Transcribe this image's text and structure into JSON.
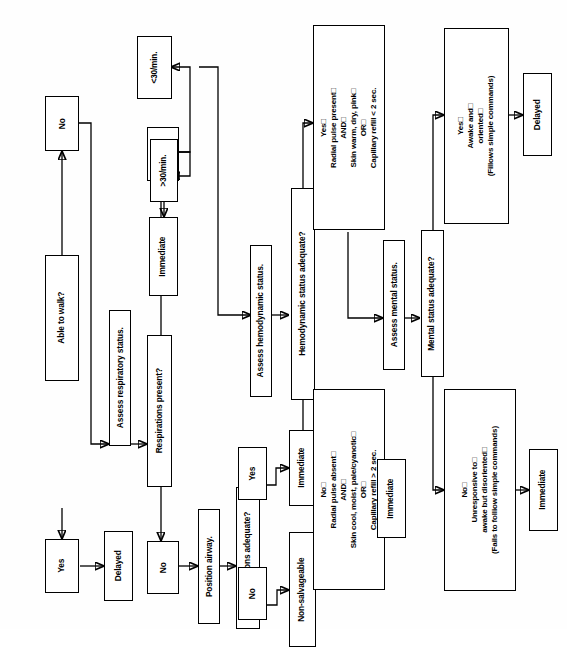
{
  "diagram": {
    "orientation": "rotated-90-counterclockwise",
    "line_color": "#000000",
    "box_fill": "#ffffff",
    "box_stroke": "#000000"
  },
  "nodes": {
    "able_to_walk": "Able to walk?",
    "walk_yes": "Yes",
    "walk_no": "No",
    "delayed_walk": "Delayed",
    "assess_respiratory": "Assess respiratory status.",
    "respirations_present": "Respirations present?",
    "resp_yes": "Yes",
    "resp_no": "No",
    "rate_over_30": ">30/min.",
    "rate_under_30": "<30/min.",
    "immediate_rate": "Immediate",
    "position_airway": "Position airway.",
    "respirations_adequate": "Respirations adequate?",
    "airway_yes": "Yes",
    "airway_no": "No",
    "immediate_airway": "Immediate",
    "non_salvageable": "Non-salvageable",
    "assess_hemodynamic": "Assess hemodynamic status.",
    "hemodynamic_adequate": "Hemodynamic status adequate?",
    "hemo_yes": "Yes□\nRadial pulse present□\nAND□\nSkin warm, dry, pink□\nOR□\nCapillary refill < 2 sec.",
    "hemo_no": "No□\nRadial pulse absent□\nAND□\nSkin cool, moist, pale/cyanotic□\nOR□\nCapillary refill > 2 sec.",
    "immediate_hemo": "Immediate",
    "assess_mental": "Assess mental status.",
    "mental_adequate": "Mental status adequate?",
    "mental_yes": "Yes□\nAwake and□\noriented□\n(Fillows simple commands)",
    "mental_no": "No□\nUnresponsive to□\nawake but disoriented□\n(Fails to folliow simple commands)",
    "delayed_mental": "Delayed",
    "immediate_mental": "Immediate"
  }
}
